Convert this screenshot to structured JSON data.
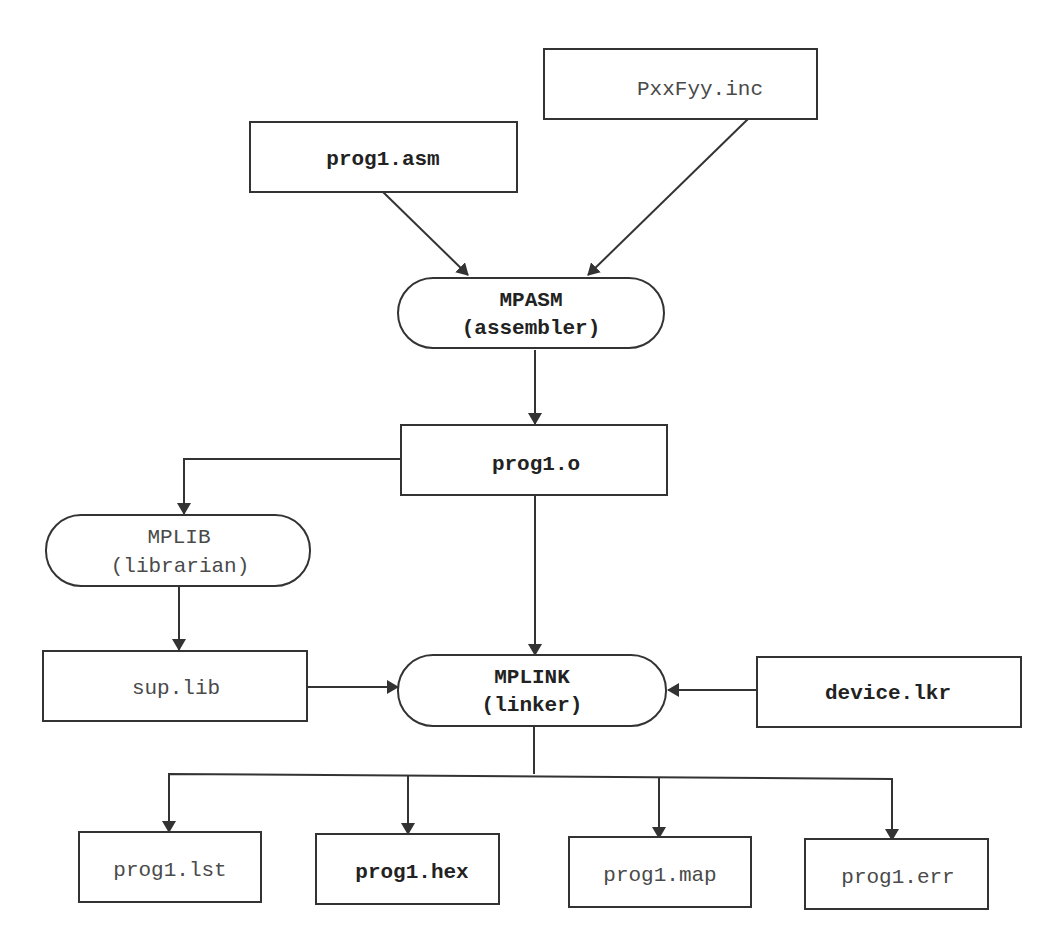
{
  "diagram": {
    "type": "flowchart",
    "title": "",
    "nodes": {
      "prog1_asm": {
        "label": "prog1.asm",
        "shape": "rect",
        "style": "bold"
      },
      "pxxfyy_inc": {
        "label": "PxxFyy.inc",
        "shape": "rect",
        "style": "normal"
      },
      "mpasm": {
        "line1": "MPASM",
        "line2": "(assembler)",
        "shape": "rounded",
        "style": "bold"
      },
      "prog1_o": {
        "label": "prog1.o",
        "shape": "rect",
        "style": "bold"
      },
      "mplib": {
        "line1": "MPLIB",
        "line2": "(librarian)",
        "shape": "rounded",
        "style": "normal"
      },
      "sup_lib": {
        "label": "sup.lib",
        "shape": "rect",
        "style": "normal"
      },
      "mplink": {
        "line1": "MPLINK",
        "line2": "(linker)",
        "shape": "rounded",
        "style": "bold"
      },
      "device_lkr": {
        "label": "device.lkr",
        "shape": "rect",
        "style": "bold"
      },
      "prog1_lst": {
        "label": "prog1.lst",
        "shape": "rect",
        "style": "normal"
      },
      "prog1_hex": {
        "label": "prog1.hex",
        "shape": "rect",
        "style": "bold"
      },
      "prog1_map": {
        "label": "prog1.map",
        "shape": "rect",
        "style": "normal"
      },
      "prog1_err": {
        "label": "prog1.err",
        "shape": "rect",
        "style": "normal"
      }
    },
    "edges": [
      {
        "from": "prog1.asm",
        "to": "MPASM"
      },
      {
        "from": "PxxFyy.inc",
        "to": "MPASM"
      },
      {
        "from": "MPASM",
        "to": "prog1.o"
      },
      {
        "from": "prog1.o",
        "to": "MPLIB"
      },
      {
        "from": "prog1.o",
        "to": "MPLINK"
      },
      {
        "from": "MPLIB",
        "to": "sup.lib"
      },
      {
        "from": "sup.lib",
        "to": "MPLINK"
      },
      {
        "from": "device.lkr",
        "to": "MPLINK"
      },
      {
        "from": "MPLINK",
        "to": "prog1.lst"
      },
      {
        "from": "MPLINK",
        "to": "prog1.hex"
      },
      {
        "from": "MPLINK",
        "to": "prog1.map"
      },
      {
        "from": "MPLINK",
        "to": "prog1.err"
      }
    ],
    "colors": {
      "stroke": "#333333",
      "text": "#2a2a2a",
      "background": "#ffffff"
    }
  }
}
